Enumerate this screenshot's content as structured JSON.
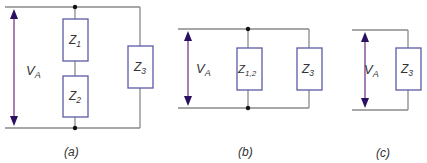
{
  "figure": {
    "panels": [
      {
        "caption": "(a)",
        "voltage": {
          "main": "V",
          "sub": "A"
        },
        "impedances": [
          {
            "main": "Z",
            "sub": "1"
          },
          {
            "main": "Z",
            "sub": "2"
          },
          {
            "main": "Z",
            "sub": "3"
          }
        ]
      },
      {
        "caption": "(b)",
        "voltage": {
          "main": "V",
          "sub": "A"
        },
        "impedances": [
          {
            "main": "Z",
            "sub": "1,2"
          },
          {
            "main": "Z",
            "sub": "3"
          }
        ]
      },
      {
        "caption": "(c)",
        "voltage": {
          "main": "V",
          "sub": "A"
        },
        "impedances": [
          {
            "main": "Z",
            "sub": "3"
          }
        ]
      }
    ],
    "colors": {
      "wire": "#8a8a8a",
      "box_border": "#5a5aa8",
      "arrow": "#7a3a8a",
      "arrow_head": "#2a1060"
    }
  }
}
